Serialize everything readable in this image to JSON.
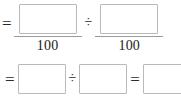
{
  "worksheet": {
    "line1": {
      "leading_operator": "=",
      "left_fraction": {
        "numerator_value": "",
        "numerator_placeholder": "",
        "denominator": "100"
      },
      "middle_operator": "÷",
      "right_fraction": {
        "numerator_value": "",
        "numerator_placeholder": "",
        "denominator": "100"
      }
    },
    "line2": {
      "leading_operator": "=",
      "first_box": {
        "value": "",
        "placeholder": ""
      },
      "divide_operator": "÷",
      "second_box": {
        "value": "",
        "placeholder": ""
      },
      "equals_operator": "=",
      "result_box": {
        "value": "",
        "placeholder": ""
      }
    }
  },
  "colors": {
    "box_border": "#b9b9b9",
    "fraction_bar": "#9a9a9a",
    "text": "#1a1a1a",
    "background": "#ffffff"
  }
}
